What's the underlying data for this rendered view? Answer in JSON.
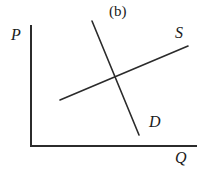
{
  "figure": {
    "panel_label": "(b)",
    "stroke_color": "#2b2b2b",
    "background_color": "#ffffff"
  },
  "axes": {
    "y_axis_label": "P",
    "x_axis_label": "Q",
    "origin": {
      "x": 31,
      "y": 146
    },
    "y_axis_top": {
      "x": 31,
      "y": 26
    },
    "x_axis_right": {
      "x": 196,
      "y": 146
    }
  },
  "curves": [
    {
      "name": "supply",
      "label": "S",
      "slope": "upward",
      "start": {
        "x": 60,
        "y": 100
      },
      "end": {
        "x": 188,
        "y": 46
      }
    },
    {
      "name": "demand",
      "label": "D",
      "slope": "downward",
      "start": {
        "x": 92,
        "y": 21
      },
      "end": {
        "x": 139,
        "y": 135
      }
    }
  ],
  "equilibrium": {
    "x": 117,
    "y": 78
  },
  "chart_data": {
    "type": "line",
    "title": "(b)",
    "xlabel": "Q",
    "ylabel": "P",
    "grid": false,
    "legend": "inline-curve-labels",
    "series": [
      {
        "name": "S",
        "points": [
          [
            60,
            100
          ],
          [
            188,
            46
          ]
        ]
      },
      {
        "name": "D",
        "points": [
          [
            92,
            21
          ],
          [
            139,
            135
          ]
        ]
      }
    ],
    "annotations": [
      "(b)",
      "P",
      "Q",
      "S",
      "D"
    ]
  }
}
